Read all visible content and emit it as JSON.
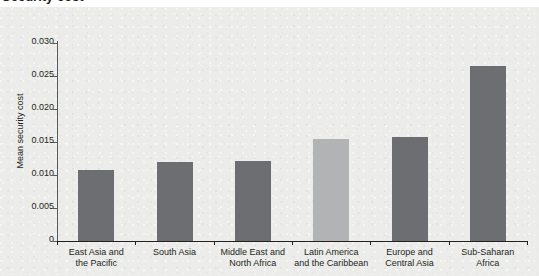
{
  "chart_data": {
    "type": "bar",
    "title": "Security cost",
    "categories": [
      "East Asia and\nthe Pacific",
      "South Asia",
      "Middle East and\nNorth Africa",
      "Latin America\nand the Caribbean",
      "Europe and\nCentral Asia",
      "Sub-Saharan\nAfrica"
    ],
    "values": [
      0.0107,
      0.012,
      0.0121,
      0.0155,
      0.0157,
      0.0265
    ],
    "xlabel": "",
    "ylabel": "Mean security cost",
    "ylim": [
      0,
      0.03
    ],
    "yticks": [
      0,
      0.005,
      0.01,
      0.015,
      0.02,
      0.025,
      0.03
    ],
    "ytick_labels": [
      "0",
      "0.005",
      "0.010",
      "0.015",
      "0.020",
      "0.025",
      "0.030"
    ],
    "grid": false,
    "legend": "none",
    "bar_colors": [
      "#6d6e71",
      "#6d6e71",
      "#6d6e71",
      "#b1b3b5",
      "#6d6e71",
      "#6d6e71"
    ],
    "highlighted_category": "Latin America\nand the Caribbean",
    "plot_background": "#ececea"
  }
}
